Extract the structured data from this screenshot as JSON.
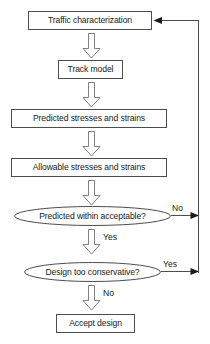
{
  "diagram": {
    "colors": {
      "node_stroke": "#4d4d4d",
      "arrow_stroke": "#595959",
      "line_stroke": "#4d4d4d",
      "text": "#1a1a1a",
      "background": "#ffffff"
    },
    "nodes": [
      {
        "id": "traffic",
        "type": "process",
        "label": "Traffic characterization"
      },
      {
        "id": "track",
        "type": "process",
        "label": "Track model"
      },
      {
        "id": "predicted",
        "type": "process",
        "label": "Predicted stresses and strains"
      },
      {
        "id": "allowable",
        "type": "process",
        "label": "Allowable stresses and strains"
      },
      {
        "id": "accept_check",
        "type": "decision",
        "label": "Predicted within acceptable?"
      },
      {
        "id": "conservative_check",
        "type": "decision",
        "label": "Design too conservative?"
      },
      {
        "id": "accept",
        "type": "process",
        "label": "Accept design"
      }
    ],
    "edge_labels": {
      "accept_check_no": "No",
      "accept_check_yes": "Yes",
      "conservative_yes": "Yes",
      "conservative_no": "No"
    }
  }
}
